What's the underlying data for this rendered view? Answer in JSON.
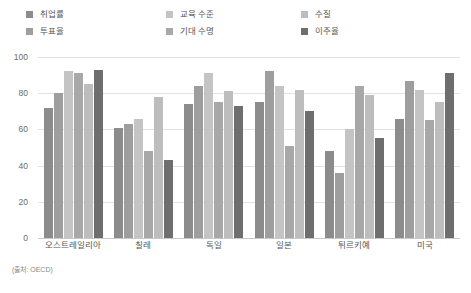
{
  "chart_data": {
    "type": "bar",
    "title": "",
    "xlabel": "",
    "ylabel": "",
    "ylim": [
      0,
      100
    ],
    "yticks": [
      "0",
      "20",
      "40",
      "60",
      "80",
      "100"
    ],
    "grid": true,
    "legend_position": "top",
    "categories": [
      "오스트레일리아",
      "칠레",
      "독일",
      "일본",
      "튀르키예",
      "미국"
    ],
    "series": [
      {
        "name": "취업률",
        "color": "#8c8c8c",
        "values": [
          72,
          61,
          74,
          75,
          48,
          66
        ]
      },
      {
        "name": "투표율",
        "color": "#9e9e9e",
        "values": [
          80,
          63,
          84,
          92,
          36,
          87
        ]
      },
      {
        "name": "교육 수준",
        "color": "#c4c4c4",
        "values": [
          92,
          66,
          91,
          84,
          60,
          82
        ]
      },
      {
        "name": "기대 수명",
        "color": "#a8a8a8",
        "values": [
          91,
          48,
          75,
          51,
          84,
          65
        ]
      },
      {
        "name": "수질",
        "color": "#bdbdbd",
        "values": [
          85,
          78,
          81,
          82,
          79,
          75
        ]
      },
      {
        "name": "이주율",
        "color": "#6e6e6e",
        "values": [
          93,
          43,
          73,
          70,
          55,
          91
        ]
      }
    ]
  },
  "legend": {
    "columns": [
      [
        {
          "label": "취업률",
          "color": "#8c8c8c",
          "icon": "legend-swatch-icon"
        },
        {
          "label": "투표율",
          "color": "#9e9e9e",
          "icon": "legend-swatch-icon"
        }
      ],
      [
        {
          "label": "교육 수준",
          "color": "#c4c4c4",
          "icon": "legend-swatch-icon"
        },
        {
          "label": "기대 수명",
          "color": "#a8a8a8",
          "icon": "legend-swatch-icon"
        }
      ],
      [
        {
          "label": "수질",
          "color": "#bdbdbd",
          "icon": "legend-swatch-icon"
        },
        {
          "label": "이주율",
          "color": "#6e6e6e",
          "icon": "legend-swatch-icon"
        }
      ]
    ]
  },
  "footer": {
    "source": "(출처: OECD)"
  }
}
